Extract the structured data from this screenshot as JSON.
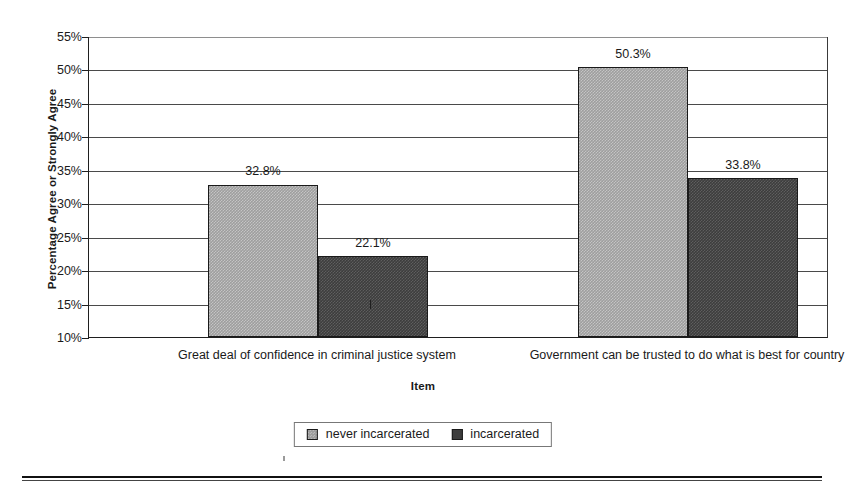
{
  "chart_data": {
    "type": "bar",
    "title": "",
    "xlabel": "Item",
    "ylabel": "Percentage Agree or Strongly Agree",
    "ylim": [
      10,
      55
    ],
    "ytick_step": 5,
    "yticks": [
      "55%",
      "50%",
      "45%",
      "40%",
      "35%",
      "30%",
      "25%",
      "20%",
      "15%",
      "10%"
    ],
    "ytick_values": [
      55,
      50,
      45,
      40,
      35,
      30,
      25,
      20,
      15,
      10
    ],
    "grid": true,
    "legend_position": "bottom",
    "categories": [
      "Great deal of confidence in criminal justice system",
      "Government can be trusted to do what is best for country"
    ],
    "series": [
      {
        "name": "never incarcerated",
        "color": "#9e9e9e",
        "values": [
          32.8,
          50.3
        ],
        "labels": [
          "32.8%",
          "50.3%"
        ]
      },
      {
        "name": "incarcerated",
        "color": "#3d3d3d",
        "values": [
          22.1,
          33.8
        ],
        "labels": [
          "22.1%",
          "33.8%"
        ]
      }
    ]
  },
  "legend": {
    "entries": [
      {
        "label": "never incarcerated"
      },
      {
        "label": "incarcerated"
      }
    ]
  }
}
